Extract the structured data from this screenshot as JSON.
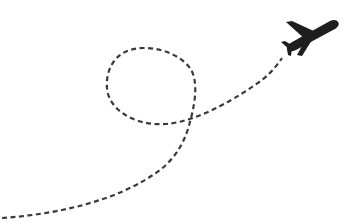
{
  "illustration": {
    "subject": "airplane with dashed flight path loop",
    "colors": {
      "background": "#ffffff",
      "path": "#3a3a3a",
      "plane": "#1e1e1e"
    },
    "icons": [
      "airplane-icon"
    ]
  }
}
